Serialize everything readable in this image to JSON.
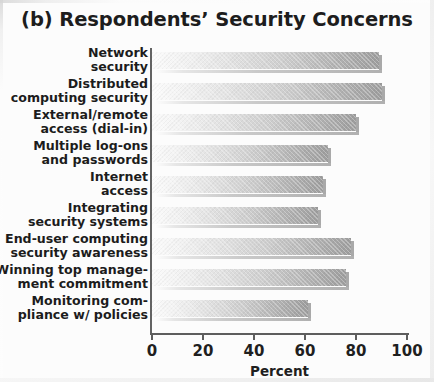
{
  "figure": {
    "title": "(b) Respondents’ Security Concerns"
  },
  "axis": {
    "x_label": "Percent",
    "x_ticks": [
      "0",
      "20",
      "40",
      "60",
      "80",
      "100"
    ]
  },
  "chart_data": {
    "type": "bar",
    "orientation": "horizontal",
    "title": "(b) Respondents’ Security Concerns",
    "xlabel": "Percent",
    "ylabel": "",
    "xlim": [
      0,
      100
    ],
    "xticks": [
      0,
      20,
      40,
      60,
      80,
      100
    ],
    "grid": false,
    "legend": null,
    "categories": [
      "Network\nsecurity",
      "Distributed\ncomputing security",
      "External/remote\naccess (dial-in)",
      "Multiple log-ons\nand passwords",
      "Internet\naccess",
      "Integrating\nsecurity systems",
      "End-user computing\nsecurity awareness",
      "Winning top manage-\nment commitment",
      "Monitoring com-\npliance w/ policies"
    ],
    "values": [
      89,
      90,
      80,
      69,
      67,
      65,
      78,
      76,
      61
    ],
    "bar_color": "#b0b0b0",
    "bar_gradient": [
      "#fbfbfb",
      "#9d9d9d"
    ]
  }
}
